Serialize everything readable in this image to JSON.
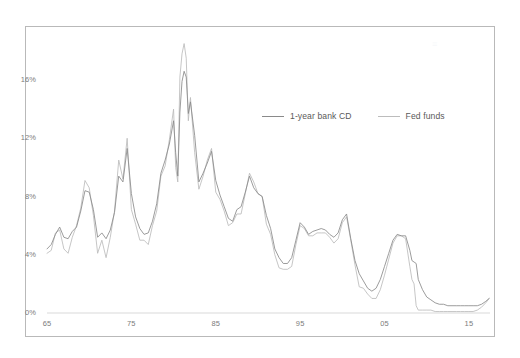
{
  "figure": {
    "title": "",
    "border_color": "#b9b9b9",
    "background": "#ffffff",
    "watermark_text": "≡"
  },
  "legend": {
    "position": "inside-top-right",
    "entries": [
      {
        "label": "1-year bank CD",
        "color": "#8a8a8a",
        "swatch": "line-swatch-solid"
      },
      {
        "label": "Fed funds",
        "color": "#bcbcbc",
        "swatch": "line-swatch-light"
      }
    ]
  },
  "axes": {
    "y_ticks": [
      "0%",
      "4%",
      "8%",
      "12%",
      "16%"
    ],
    "x_ticks": [
      "65",
      "75",
      "85",
      "95",
      "05",
      "15"
    ],
    "y_label": "",
    "x_label": "",
    "tick_color": "#7c7c7c"
  },
  "chart_data": {
    "type": "line",
    "title": "",
    "subtitle": "",
    "xlabel": "",
    "ylabel": "",
    "xlim": [
      1965,
      2017.5
    ],
    "ylim": [
      0,
      18
    ],
    "ytick_values": [
      0,
      4,
      8,
      12,
      16
    ],
    "ytick_labels": [
      "0%",
      "4%",
      "8%",
      "12%",
      "16%"
    ],
    "xtick_values": [
      1965,
      1975,
      1985,
      1995,
      2005,
      2015
    ],
    "xtick_labels": [
      "65",
      "75",
      "85",
      "95",
      "05",
      "15"
    ],
    "grid": false,
    "legend_position": "inside-top-right",
    "x": [
      1965.0,
      1965.5,
      1966.0,
      1966.5,
      1967.0,
      1967.5,
      1968.0,
      1968.5,
      1969.0,
      1969.5,
      1970.0,
      1970.5,
      1971.0,
      1971.5,
      1972.0,
      1972.5,
      1973.0,
      1973.5,
      1974.0,
      1974.5,
      1975.0,
      1975.5,
      1976.0,
      1976.5,
      1977.0,
      1977.5,
      1978.0,
      1978.5,
      1979.0,
      1979.5,
      1980.0,
      1980.25,
      1980.5,
      1980.75,
      1981.0,
      1981.25,
      1981.5,
      1981.75,
      1982.0,
      1982.5,
      1983.0,
      1983.5,
      1984.0,
      1984.5,
      1985.0,
      1985.5,
      1986.0,
      1986.5,
      1987.0,
      1987.5,
      1988.0,
      1988.5,
      1989.0,
      1989.5,
      1990.0,
      1990.5,
      1991.0,
      1991.5,
      1992.0,
      1992.5,
      1993.0,
      1993.5,
      1994.0,
      1994.5,
      1995.0,
      1995.5,
      1996.0,
      1996.5,
      1997.0,
      1997.5,
      1998.0,
      1998.5,
      1999.0,
      1999.5,
      2000.0,
      2000.5,
      2001.0,
      2001.5,
      2002.0,
      2002.5,
      2003.0,
      2003.5,
      2004.0,
      2004.5,
      2005.0,
      2005.5,
      2006.0,
      2006.5,
      2007.0,
      2007.5,
      2008.0,
      2008.25,
      2008.5,
      2008.75,
      2009.0,
      2009.5,
      2010.0,
      2010.5,
      2011.0,
      2011.5,
      2012.0,
      2012.5,
      2013.0,
      2013.5,
      2014.0,
      2014.5,
      2015.0,
      2015.5,
      2016.0,
      2016.5,
      2017.0,
      2017.4
    ],
    "series": [
      {
        "name": "1-year bank CD",
        "color": "#8a8a8a",
        "values": [
          4.4,
          4.7,
          5.4,
          5.9,
          5.2,
          5.1,
          5.6,
          5.9,
          7.0,
          8.4,
          8.3,
          7.1,
          5.2,
          5.5,
          5.1,
          5.7,
          6.9,
          9.4,
          9.0,
          11.3,
          8.2,
          6.6,
          5.8,
          5.4,
          5.5,
          6.3,
          7.5,
          9.6,
          10.5,
          11.6,
          13.2,
          11.0,
          9.4,
          13.8,
          15.9,
          16.6,
          16.2,
          13.7,
          14.5,
          12.2,
          9.0,
          9.6,
          10.3,
          11.1,
          9.1,
          8.1,
          7.3,
          6.5,
          6.3,
          7.1,
          7.3,
          8.3,
          9.4,
          8.6,
          8.2,
          8.0,
          6.7,
          5.8,
          4.4,
          3.8,
          3.4,
          3.4,
          3.8,
          5.0,
          6.2,
          5.9,
          5.4,
          5.6,
          5.7,
          5.8,
          5.7,
          5.4,
          5.2,
          5.5,
          6.4,
          6.8,
          5.1,
          3.6,
          2.7,
          2.2,
          1.7,
          1.5,
          1.7,
          2.3,
          3.2,
          4.1,
          5.0,
          5.4,
          5.3,
          5.3,
          4.3,
          3.6,
          3.5,
          3.4,
          2.3,
          1.6,
          1.1,
          0.9,
          0.7,
          0.6,
          0.6,
          0.5,
          0.5,
          0.5,
          0.5,
          0.5,
          0.5,
          0.5,
          0.5,
          0.6,
          0.8,
          1.0
        ]
      },
      {
        "name": "Fed funds",
        "color": "#bcbcbc",
        "values": [
          4.1,
          4.3,
          5.5,
          5.7,
          4.4,
          4.1,
          5.2,
          6.0,
          7.2,
          9.1,
          8.6,
          6.7,
          4.1,
          5.0,
          3.8,
          5.2,
          7.0,
          10.5,
          9.2,
          12.0,
          7.1,
          6.1,
          5.0,
          5.0,
          4.7,
          6.0,
          7.0,
          9.4,
          10.1,
          11.9,
          14.0,
          10.0,
          9.0,
          16.2,
          17.8,
          18.5,
          17.5,
          13.2,
          14.8,
          11.0,
          8.5,
          9.4,
          10.5,
          11.3,
          8.3,
          7.8,
          7.0,
          6.0,
          6.2,
          6.8,
          6.8,
          8.2,
          9.6,
          9.0,
          8.2,
          8.0,
          6.1,
          5.4,
          4.0,
          3.1,
          3.0,
          3.0,
          3.2,
          4.7,
          6.0,
          5.8,
          5.3,
          5.3,
          5.5,
          5.5,
          5.5,
          5.2,
          4.8,
          5.1,
          6.2,
          6.6,
          5.0,
          3.3,
          1.8,
          1.7,
          1.3,
          1.0,
          1.0,
          1.6,
          2.6,
          3.7,
          4.8,
          5.3,
          5.3,
          5.1,
          3.2,
          2.3,
          2.0,
          0.5,
          0.2,
          0.2,
          0.2,
          0.2,
          0.1,
          0.1,
          0.1,
          0.1,
          0.1,
          0.1,
          0.1,
          0.1,
          0.1,
          0.1,
          0.2,
          0.4,
          0.7,
          1.0
        ]
      }
    ]
  }
}
